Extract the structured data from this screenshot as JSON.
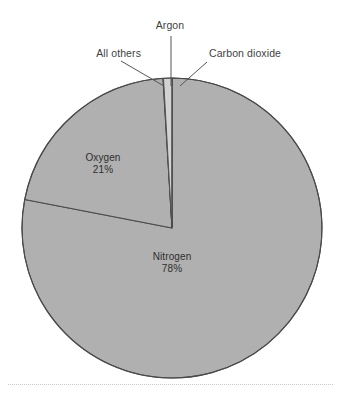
{
  "figure": {
    "background_color": "#ffffff",
    "width": 341,
    "height": 401
  },
  "chart_data": {
    "type": "pie",
    "title": "",
    "subtitle": "",
    "xlabel": "",
    "ylabel": "",
    "legend_position": "none",
    "grid": false,
    "categories": [
      "Nitrogen",
      "Oxygen",
      "Argon",
      "Carbon dioxide",
      "All others"
    ],
    "values": [
      78,
      21,
      0.9,
      0.04,
      0.06
    ],
    "value_labels": [
      "78%",
      "21%",
      "",
      "",
      ""
    ],
    "start_angle_deg": -90,
    "direction": "clockwise",
    "slices": [
      {
        "name": "Nitrogen",
        "label": "Nitrogen",
        "percent_label": "78%",
        "value": 78,
        "color": "#b0b0b0",
        "label_placement": "inside",
        "label_x": 172,
        "label_y": 255
      },
      {
        "name": "Oxygen",
        "label": "Oxygen",
        "percent_label": "21%",
        "value": 21,
        "color": "#b0b0b0",
        "label_placement": "inside",
        "label_x": 103,
        "label_y": 157
      },
      {
        "name": "Argon",
        "label": "Argon",
        "percent_label": "",
        "value": 0.9,
        "color": "#d2d2d2",
        "label_placement": "callout",
        "label_x": 170,
        "label_y": 24,
        "leader_from_x": 171,
        "leader_from_y": 36,
        "leader_to_x": 171,
        "leader_to_y": 86
      },
      {
        "name": "Carbon dioxide",
        "label": "Carbon dioxide",
        "percent_label": "",
        "value": 0.04,
        "color": "#b0b0b0",
        "label_placement": "callout",
        "label_x": 212,
        "label_y": 52,
        "leader_from_x": 207,
        "leader_from_y": 62,
        "leader_to_x": 180,
        "leader_to_y": 86
      },
      {
        "name": "All others",
        "label": "All others",
        "percent_label": "",
        "value": 0.06,
        "color": "#b0b0b0",
        "label_placement": "callout",
        "label_x": 117,
        "label_y": 52,
        "leader_from_x": 121,
        "leader_from_y": 61,
        "leader_to_x": 164,
        "leader_to_y": 86
      }
    ],
    "geometry": {
      "center_x": 172,
      "center_y": 228,
      "radius": 150
    },
    "colors": {
      "slice_fill": "#b0b0b0",
      "argon_fill": "#d2d2d2",
      "slice_stroke": "#4a4a4a",
      "label_text": "#3f3f3f",
      "inner_label_text": "#2f2f2f",
      "leader_line": "#555555",
      "rule": "#c9c9c9"
    }
  },
  "labels": {
    "argon": "Argon",
    "all_others": "All others",
    "carbon_dioxide": "Carbon dioxide",
    "oxygen_name": "Oxygen",
    "oxygen_pct": "21%",
    "nitrogen_name": "Nitrogen",
    "nitrogen_pct": "78%"
  }
}
